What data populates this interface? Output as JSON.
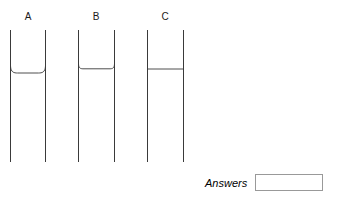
{
  "page": {
    "background_color": "#ffffff",
    "stroke_color": "#3a3a3a",
    "width": 339,
    "height": 207
  },
  "figure": {
    "caption": "",
    "tubes": [
      {
        "id": "A",
        "label": "A",
        "meniscus_shape": "concave",
        "meniscus_description": "liquid surface curves upward at the tube walls",
        "liquid_level_y": 72,
        "left_wall_x": 10,
        "right_wall_x": 45,
        "top_y": 30,
        "bottom_y": 162
      },
      {
        "id": "B",
        "label": "B",
        "meniscus_shape": "flat-rounded",
        "meniscus_description": "liquid surface nearly flat with slight rounding at the walls",
        "liquid_level_y": 68,
        "left_wall_x": 78,
        "right_wall_x": 114,
        "top_y": 30,
        "bottom_y": 162
      },
      {
        "id": "C",
        "label": "C",
        "meniscus_shape": "flat",
        "meniscus_description": "liquid surface perfectly flat and horizontal",
        "liquid_level_y": 69,
        "left_wall_x": 147,
        "right_wall_x": 183,
        "top_y": 30,
        "bottom_y": 162
      }
    ]
  },
  "answers": {
    "label": "Answers",
    "value": "",
    "placeholder": ""
  }
}
